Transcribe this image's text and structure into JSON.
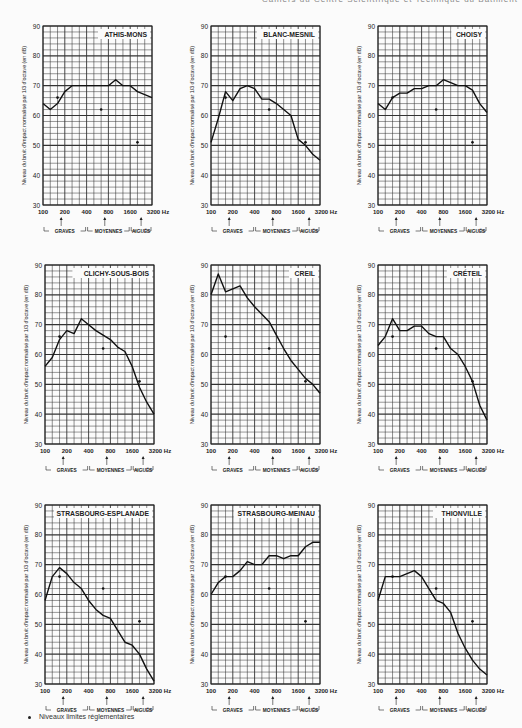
{
  "header": {
    "text": "Cahiers du Centre Scientifique et Technique du Bâtiment"
  },
  "legend": {
    "marker": "•",
    "label": "Niveaux limites réglementaires"
  },
  "axis": {
    "ylabel": "Niveau du bruit d'impact normalisé par 1/3 d'octave (en dB)",
    "yticks": [
      "90",
      "80",
      "70",
      "60",
      "50",
      "40",
      "30"
    ],
    "xticks": [
      "100",
      "200",
      "400",
      "800",
      "1600",
      "3200 Hz"
    ],
    "bands": [
      "GRAVES",
      "MOYENNES",
      "AIGUËS"
    ]
  },
  "chart_data": [
    {
      "type": "line",
      "title": "ATHIS-MONS",
      "xlabel": "Hz",
      "ylabel": "Niveau du bruit d'impact normalisé par 1/3 d'octave (en dB)",
      "x": [
        100,
        125,
        160,
        200,
        250,
        315,
        400,
        500,
        630,
        800,
        1000,
        1250,
        1600,
        2000,
        2500,
        3200
      ],
      "values": [
        64,
        62,
        64,
        68,
        70,
        70,
        70,
        70,
        70,
        70,
        72,
        70,
        70,
        68,
        67,
        66
      ],
      "limits": {
        "x": [
          160,
          630,
          2000
        ],
        "values": [
          66,
          62,
          51
        ]
      },
      "ylim": [
        30,
        90
      ],
      "grid": true
    },
    {
      "type": "line",
      "title": "BLANC-MESNIL",
      "xlabel": "Hz",
      "ylabel": "Niveau du bruit d'impact normalisé par 1/3 d'octave (en dB)",
      "x": [
        100,
        125,
        160,
        200,
        250,
        315,
        400,
        500,
        630,
        800,
        1000,
        1250,
        1600,
        2000,
        2500,
        3200
      ],
      "values": [
        51,
        59,
        68,
        65,
        69,
        70,
        69,
        65.5,
        65.5,
        64,
        62,
        60,
        52,
        50,
        47,
        45
      ],
      "limits": {
        "x": [
          160,
          630,
          2000
        ],
        "values": [
          66,
          62,
          51
        ]
      },
      "ylim": [
        30,
        90
      ],
      "grid": true
    },
    {
      "type": "line",
      "title": "CHOISY",
      "xlabel": "Hz",
      "ylabel": "Niveau du bruit d'impact normalisé par 1/3 d'octave (en dB)",
      "x": [
        100,
        125,
        160,
        200,
        250,
        315,
        400,
        500,
        630,
        800,
        1000,
        1250,
        1600,
        2000,
        2500,
        3200
      ],
      "values": [
        64,
        62,
        66,
        67.5,
        67.5,
        69,
        69,
        70,
        70,
        72,
        71,
        70,
        70,
        68.5,
        64,
        61
      ],
      "limits": {
        "x": [
          160,
          630,
          2000
        ],
        "values": [
          66,
          62,
          51
        ]
      },
      "ylim": [
        30,
        90
      ],
      "grid": true
    },
    {
      "type": "line",
      "title": "CLICHY-SOUS-BOIS",
      "xlabel": "Hz",
      "ylabel": "Niveau du bruit d'impact normalisé par 1/3 d'octave (en dB)",
      "x": [
        100,
        125,
        160,
        200,
        250,
        315,
        400,
        500,
        630,
        800,
        1000,
        1250,
        1600,
        2000,
        2500,
        3200
      ],
      "values": [
        56,
        59,
        65,
        68,
        67,
        72,
        70,
        68,
        66.5,
        65,
        62.5,
        61,
        56,
        49,
        44,
        40
      ],
      "limits": {
        "x": [
          160,
          630,
          2000
        ],
        "values": [
          66,
          62,
          51
        ]
      },
      "ylim": [
        30,
        90
      ],
      "grid": true
    },
    {
      "type": "line",
      "title": "CREIL",
      "xlabel": "Hz",
      "ylabel": "Niveau du bruit d'impact normalisé par 1/3 d'octave (en dB)",
      "x": [
        100,
        125,
        160,
        200,
        250,
        315,
        400,
        500,
        630,
        800,
        1000,
        1250,
        1600,
        2000,
        2500,
        3200
      ],
      "values": [
        80,
        87,
        81,
        82,
        83,
        79,
        76,
        73.5,
        71,
        66.5,
        62,
        58,
        55,
        52,
        50,
        47
      ],
      "limits": {
        "x": [
          160,
          630,
          2000
        ],
        "values": [
          66,
          62,
          51
        ]
      },
      "ylim": [
        30,
        90
      ],
      "grid": true
    },
    {
      "type": "line",
      "title": "CRÉTEIL",
      "xlabel": "Hz",
      "ylabel": "Niveau du bruit d'impact normalisé par 1/3 d'octave (en dB)",
      "x": [
        100,
        125,
        160,
        200,
        250,
        315,
        400,
        500,
        630,
        800,
        1000,
        1250,
        1600,
        2000,
        2500,
        3200
      ],
      "values": [
        63,
        66,
        72,
        68,
        68,
        69.5,
        69.5,
        67,
        66,
        66,
        62,
        60,
        56,
        51,
        43,
        38
      ],
      "limits": {
        "x": [
          160,
          630,
          2000
        ],
        "values": [
          66,
          62,
          51
        ]
      },
      "ylim": [
        30,
        90
      ],
      "grid": true
    },
    {
      "type": "line",
      "title": "STRASBOURG-ESPLANADE",
      "xlabel": "Hz",
      "ylabel": "Niveau du bruit d'impact normalisé par 1/3 d'octave (en dB)",
      "x": [
        100,
        125,
        160,
        200,
        250,
        315,
        400,
        500,
        630,
        800,
        1000,
        1250,
        1600,
        2000,
        2500,
        3200
      ],
      "values": [
        58,
        66,
        69,
        67,
        64,
        62,
        58,
        55,
        53,
        52,
        48,
        44,
        43,
        40,
        35,
        31
      ],
      "limits": {
        "x": [
          160,
          630,
          2000
        ],
        "values": [
          66,
          62,
          51
        ]
      },
      "ylim": [
        30,
        90
      ],
      "grid": true
    },
    {
      "type": "line",
      "title": "STRASBOURG-MEINAU",
      "xlabel": "Hz",
      "ylabel": "Niveau du bruit d'impact normalisé par 1/3 d'octave (en dB)",
      "x": [
        100,
        125,
        160,
        200,
        250,
        315,
        400,
        500,
        630,
        800,
        1000,
        1250,
        1600,
        2000,
        2500,
        3200
      ],
      "values": [
        60,
        64,
        66,
        66,
        68,
        71,
        70,
        70,
        73,
        73,
        72,
        73,
        73,
        76,
        77.5,
        77.5
      ],
      "limits": {
        "x": [
          160,
          630,
          2000
        ],
        "values": [
          66,
          62,
          51
        ]
      },
      "ylim": [
        30,
        90
      ],
      "grid": true
    },
    {
      "type": "line",
      "title": "THIONVILLE",
      "xlabel": "Hz",
      "ylabel": "Niveau du bruit d'impact normalisé par 1/3 d'octave (en dB)",
      "x": [
        100,
        125,
        160,
        200,
        250,
        315,
        400,
        500,
        630,
        800,
        1000,
        1250,
        1600,
        2000,
        2500,
        3200
      ],
      "values": [
        58,
        66,
        66,
        66,
        67,
        68,
        66,
        62,
        58,
        57,
        54,
        47,
        42,
        38,
        35,
        33
      ],
      "limits": {
        "x": [
          160,
          630,
          2000
        ],
        "values": [
          66,
          62,
          51
        ]
      },
      "ylim": [
        30,
        90
      ],
      "grid": true
    }
  ]
}
